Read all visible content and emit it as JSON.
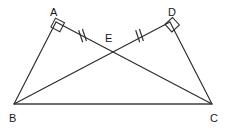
{
  "figure": {
    "canvas": {
      "width": 229,
      "height": 131,
      "background": "#ffffff"
    },
    "stroke_color": "#2b2b2b",
    "base_stroke_color": "#6e6e6e",
    "label_color": "#1a1a1a",
    "points": [
      {
        "id": "A",
        "label": "A",
        "x": 56,
        "y": 22,
        "label_x": 50,
        "label_y": 7
      },
      {
        "id": "B",
        "label": "B",
        "x": 14,
        "y": 104,
        "label_x": 9,
        "label_y": 113
      },
      {
        "id": "C",
        "label": "C",
        "x": 212,
        "y": 104,
        "label_x": 210,
        "label_y": 113
      },
      {
        "id": "D",
        "label": "D",
        "x": 170,
        "y": 22,
        "label_x": 168,
        "label_y": 7
      },
      {
        "id": "E",
        "label": "E",
        "x": 113,
        "y": 50,
        "label_x": 105,
        "label_y": 33
      }
    ],
    "segments": [
      {
        "name": "segment-BA",
        "from": "B",
        "to": "A",
        "style": "thin"
      },
      {
        "name": "segment-AC",
        "from": "A",
        "to": "C",
        "style": "thin"
      },
      {
        "name": "segment-BD",
        "from": "B",
        "to": "D",
        "style": "thin"
      },
      {
        "name": "segment-DC",
        "from": "D",
        "to": "C",
        "style": "thin"
      },
      {
        "name": "segment-BC",
        "from": "B",
        "to": "C",
        "style": "base"
      }
    ],
    "right_angles": [
      {
        "name": "right-angle-A",
        "at": "A",
        "arms": [
          "B",
          "C"
        ],
        "size": 10
      },
      {
        "name": "right-angle-D",
        "at": "D",
        "arms": [
          "C",
          "B"
        ],
        "size": 10
      }
    ],
    "congruence_ticks": [
      {
        "name": "tick-AE",
        "on_segment": "A-E",
        "position": 0.52,
        "count": 2
      },
      {
        "name": "tick-DE",
        "on_segment": "D-E",
        "position": 0.52,
        "count": 2
      }
    ]
  }
}
